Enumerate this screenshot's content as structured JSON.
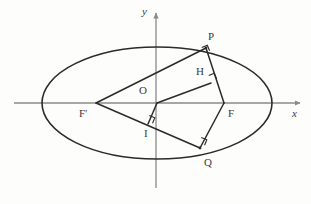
{
  "figure": {
    "background_color": "#fdfdfc",
    "stroke_color": "#2b2b2b",
    "axis_color": "#8a8a8a",
    "label_color": "#3a3a3a",
    "axes": {
      "x_label": "x",
      "y_label": "y",
      "origin_label": "O",
      "x_axis_start": {
        "x": 14,
        "y": 103
      },
      "x_axis_end": {
        "x": 300,
        "y": 103
      },
      "y_axis_start": {
        "x": 156,
        "y": 188
      },
      "y_axis_end": {
        "x": 156,
        "y": 13
      }
    },
    "ellipse": {
      "center": {
        "x": 157,
        "y": 103
      },
      "semi_major_x": 115,
      "semi_minor_y": 56
    },
    "points": [
      {
        "name": "P",
        "label": "P",
        "x": 206,
        "y": 48,
        "label_x": 208,
        "label_y": 31,
        "on_curve": true
      },
      {
        "name": "Q",
        "label": "Q",
        "x": 200,
        "y": 148,
        "label_x": 204,
        "label_y": 157,
        "on_curve": true
      },
      {
        "name": "F",
        "label": "F",
        "x": 224,
        "y": 103,
        "label_x": 228,
        "label_y": 108,
        "on_curve": false
      },
      {
        "name": "Fp",
        "label": "F′",
        "x": 96,
        "y": 103,
        "label_x": 79,
        "label_y": 108,
        "on_curve": false
      },
      {
        "name": "O",
        "label": "O",
        "x": 157,
        "y": 103,
        "label_x": 139,
        "label_y": 85,
        "on_curve": false
      },
      {
        "name": "H",
        "label": "H",
        "x": 211,
        "y": 83,
        "label_x": 196,
        "label_y": 66,
        "on_curve": false
      },
      {
        "name": "I",
        "label": "I",
        "x": 148,
        "y": 124,
        "label_x": 144,
        "label_y": 128,
        "on_curve": false
      }
    ],
    "segments": [
      {
        "name": "F-prime-to-P",
        "from": "Fp",
        "to": "P"
      },
      {
        "name": "F-prime-to-Q",
        "from": "Fp",
        "to": "Q"
      },
      {
        "name": "P-to-F",
        "from": "P",
        "to": "F"
      },
      {
        "name": "Q-to-F",
        "from": "Q",
        "to": "F"
      },
      {
        "name": "O-to-H",
        "from": "O",
        "to": "H"
      },
      {
        "name": "O-to-I",
        "from": "O",
        "to": "I"
      }
    ],
    "right_angle_marks": [
      {
        "name": "right-angle-at-P",
        "x": 204,
        "y": 53,
        "rotation": -22
      },
      {
        "name": "right-angle-at-H",
        "x": 211,
        "y": 81,
        "rotation": -22
      },
      {
        "name": "right-angle-at-I",
        "x": 147,
        "y": 121,
        "rotation": 22
      },
      {
        "name": "right-angle-at-Q",
        "x": 199,
        "y": 143,
        "rotation": 22
      }
    ]
  }
}
